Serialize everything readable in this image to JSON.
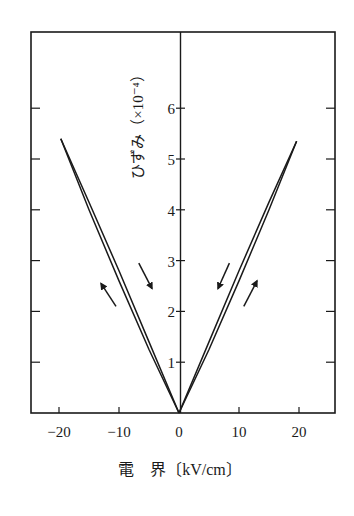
{
  "chart_data": {
    "type": "line",
    "title": "",
    "xlabel": "電　界〔kV/cm〕",
    "ylabel": "ひずみ（×10⁻⁴）",
    "xlim": [
      -24.7,
      26
    ],
    "ylim": [
      0,
      7.5
    ],
    "x_ticks": [
      -20,
      -10,
      0,
      10,
      20
    ],
    "x_tick_labels": [
      "−20",
      "−10",
      "0",
      "10",
      "20"
    ],
    "y_ticks": [
      1,
      2,
      3,
      4,
      5,
      6
    ],
    "y_tick_labels": [
      "1",
      "2",
      "3",
      "4",
      "5",
      "6"
    ],
    "grid": false,
    "legend": null,
    "series": [
      {
        "name": "left-increasing",
        "x": [
          0,
          -5,
          -10,
          -15,
          -19.7
        ],
        "y": [
          0,
          1.25,
          2.6,
          4.0,
          5.4
        ]
      },
      {
        "name": "left-decreasing",
        "x": [
          -19.7,
          -15,
          -10,
          -5,
          0
        ],
        "y": [
          5.4,
          4.15,
          2.8,
          1.4,
          0
        ]
      },
      {
        "name": "right-increasing",
        "x": [
          0,
          5,
          10,
          15,
          19.6
        ],
        "y": [
          0,
          1.25,
          2.6,
          4.0,
          5.35
        ]
      },
      {
        "name": "right-decreasing",
        "x": [
          19.6,
          15,
          10,
          5,
          0
        ],
        "y": [
          5.35,
          4.15,
          2.8,
          1.4,
          0
        ]
      }
    ],
    "annotations": [
      {
        "type": "arrow",
        "from": [
          -10.5,
          2.1
        ],
        "to": [
          -13,
          2.55
        ],
        "direction": "up-left"
      },
      {
        "type": "arrow",
        "from": [
          -6.7,
          2.95
        ],
        "to": [
          -4.5,
          2.45
        ],
        "direction": "down-right"
      },
      {
        "type": "arrow",
        "from": [
          8.4,
          2.95
        ],
        "to": [
          6.5,
          2.45
        ],
        "direction": "down-left"
      },
      {
        "type": "arrow",
        "from": [
          10.8,
          2.1
        ],
        "to": [
          13,
          2.6
        ],
        "direction": "up-right"
      }
    ]
  },
  "labels": {
    "ylabel": "ひずみ（×10⁻⁴）",
    "xlabel": "電　界〔kV/cm〕"
  }
}
